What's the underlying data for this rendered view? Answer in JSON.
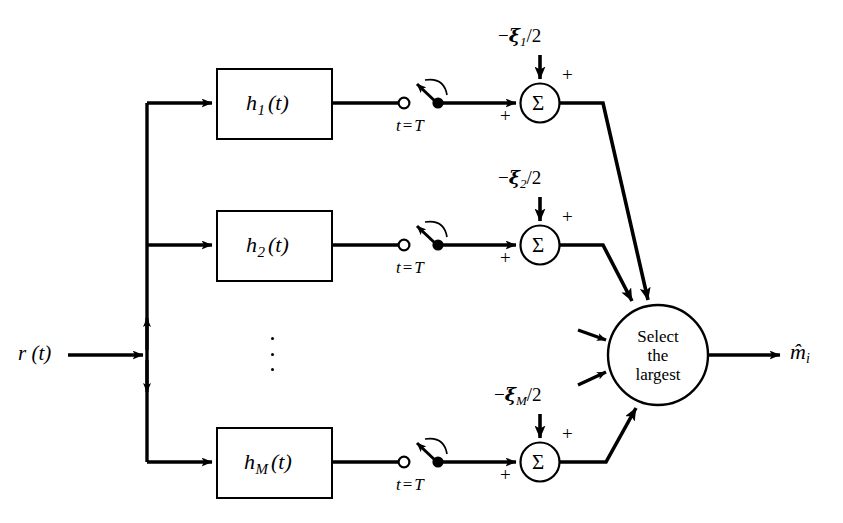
{
  "figure": {
    "type": "block-diagram",
    "background_color": "#ffffff",
    "line_color": "#000000"
  },
  "input": {
    "label": "r (t)",
    "name": "received-signal"
  },
  "branches": [
    {
      "id": "branch-1",
      "filter_label_main": "h",
      "filter_label_sub": "1",
      "filter_label_arg": "(t)",
      "sampler_label_var": "t",
      "sampler_label_eq": "=",
      "sampler_label_val": "T",
      "bias_minus": "−",
      "bias_xi": "ξ",
      "bias_sub": "1",
      "bias_div": "/2",
      "sum_symbol": "Σ",
      "plus_top": "+",
      "plus_left": "+"
    },
    {
      "id": "branch-2",
      "filter_label_main": "h",
      "filter_label_sub": "2",
      "filter_label_arg": "(t)",
      "sampler_label_var": "t",
      "sampler_label_eq": "=",
      "sampler_label_val": "T",
      "bias_minus": "−",
      "bias_xi": "ξ",
      "bias_sub": "2",
      "bias_div": "/2",
      "sum_symbol": "Σ",
      "plus_top": "+",
      "plus_left": "+"
    },
    {
      "id": "branch-M",
      "filter_label_main": "h",
      "filter_label_sub": "M",
      "filter_label_arg": "(t)",
      "sampler_label_var": "t",
      "sampler_label_eq": "=",
      "sampler_label_val": "T",
      "bias_minus": "−",
      "bias_xi": "ξ",
      "bias_sub": "M",
      "bias_div": "/2",
      "sum_symbol": "Σ",
      "plus_top": "+",
      "plus_left": "+"
    }
  ],
  "ellipsis": {
    "label": "vertical-ellipsis",
    "dot_count": 3
  },
  "decision": {
    "line1": "Select",
    "line2": "the",
    "line3": "largest",
    "name": "select-the-largest"
  },
  "output": {
    "symbol": "m̂",
    "sub": "i"
  }
}
